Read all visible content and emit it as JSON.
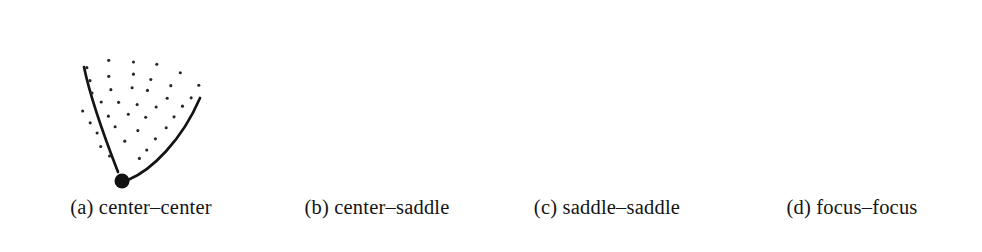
{
  "figure": {
    "background_color": "#ffffff",
    "ink_color": "#141414",
    "width": 982,
    "height": 252
  },
  "panels": [
    {
      "id": "a",
      "label": "(a)",
      "name": "center–center",
      "caption": "(a) center–center",
      "node": {
        "cx": 122,
        "cy": 181,
        "r": 7.5,
        "color": "#111111"
      },
      "curves": [
        "M 84,67 C 90,96 104,136 118,172",
        "M 128,180 C 152,170 182,140 200,98"
      ],
      "dot_region": "wedge",
      "dot_count": 40,
      "curve_count": 2
    },
    {
      "id": "b",
      "label": "(b)",
      "name": "center–saddle",
      "caption": "(b) center–saddle",
      "node": {
        "cx": 385,
        "cy": 157,
        "r": 7.5,
        "color": "#111111"
      },
      "curves": [
        "M 343,32 C 352,70 372,122 382,150",
        "M 300,196 C 330,182 362,166 379,159",
        "M 392,155 C 420,150 452,146 470,145"
      ],
      "dot_region": "fan",
      "dot_count": 58,
      "curve_count": 3
    },
    {
      "id": "c",
      "label": "(c)",
      "name": "saddle–saddle",
      "caption": "(c) saddle–saddle",
      "node": {
        "cx": 603,
        "cy": 88,
        "r": 8,
        "color": "#111111"
      },
      "curves": [
        "M 564,2 C 576,30 594,66 600,82",
        "M 610,82 C 632,64 660,44 678,32",
        "M 608,96 C 614,128 616,168 614,198",
        "M 596,96 C 578,120 556,148 542,170"
      ],
      "dot_region": "disk",
      "dot_count": 72,
      "curve_count": 4
    },
    {
      "id": "d",
      "label": "(d)",
      "name": "focus–focus",
      "caption": "(d) focus–focus",
      "node": {
        "cx": 849,
        "cy": 113,
        "r": 9,
        "color": "#111111"
      },
      "curves": [],
      "dot_region": "spiral-disk",
      "dot_count": 60,
      "curve_count": 0
    }
  ],
  "caption_row": {
    "y": 208,
    "font_size_px": 20.5,
    "items": [
      "(a) center–center",
      "(b) center–saddle",
      "(c) saddle–saddle",
      "(d) focus–focus"
    ]
  }
}
